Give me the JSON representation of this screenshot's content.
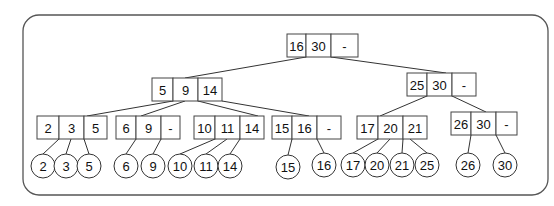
{
  "diagram": {
    "type": "2-3-4 tree / B-tree",
    "frame": {
      "x": 23,
      "y": 15,
      "w": 525,
      "h": 180,
      "r": 16
    },
    "nodes": [
      {
        "id": "root",
        "keys": [
          "16",
          "30",
          "-"
        ],
        "x": 287,
        "y": 34,
        "cells": [
          19,
          25,
          27
        ],
        "h": 23
      },
      {
        "id": "n5_9_14",
        "keys": [
          "5",
          "9",
          "14"
        ],
        "x": 152,
        "y": 78,
        "cells": [
          21,
          25,
          24
        ],
        "h": 23
      },
      {
        "id": "n25_30",
        "keys": [
          "25",
          "30",
          "-"
        ],
        "x": 407,
        "y": 73,
        "cells": [
          20,
          25,
          24
        ],
        "h": 23
      },
      {
        "id": "n2_3_5",
        "keys": [
          "2",
          "3",
          "5"
        ],
        "x": 37,
        "y": 116,
        "cells": [
          22,
          25,
          23
        ],
        "h": 23
      },
      {
        "id": "n6_9",
        "keys": [
          "6",
          "9",
          "-"
        ],
        "x": 116,
        "y": 116,
        "cells": [
          20,
          25,
          19
        ],
        "h": 23
      },
      {
        "id": "n10_11_14",
        "keys": [
          "10",
          "11",
          "14"
        ],
        "x": 194,
        "y": 116,
        "cells": [
          21,
          25,
          24
        ],
        "h": 23
      },
      {
        "id": "n15_16",
        "keys": [
          "15",
          "16",
          "-"
        ],
        "x": 272,
        "y": 116,
        "cells": [
          20,
          25,
          24
        ],
        "h": 23
      },
      {
        "id": "n17_20_21",
        "keys": [
          "17",
          "20",
          "21"
        ],
        "x": 357,
        "y": 116,
        "cells": [
          21,
          25,
          24
        ],
        "h": 23
      },
      {
        "id": "n26_30",
        "keys": [
          "26",
          "30",
          "-"
        ],
        "x": 451,
        "y": 112,
        "cells": [
          20,
          25,
          21
        ],
        "h": 23
      }
    ],
    "leaves": [
      {
        "label": "2",
        "cx": 43,
        "cy": 166
      },
      {
        "label": "3",
        "cx": 66,
        "cy": 166
      },
      {
        "label": "5",
        "cx": 89,
        "cy": 166
      },
      {
        "label": "6",
        "cx": 126,
        "cy": 166
      },
      {
        "label": "9",
        "cx": 153,
        "cy": 166
      },
      {
        "label": "10",
        "cx": 180,
        "cy": 166
      },
      {
        "label": "11",
        "cx": 206,
        "cy": 166
      },
      {
        "label": "14",
        "cx": 230,
        "cy": 166
      },
      {
        "label": "15",
        "cx": 288,
        "cy": 167
      },
      {
        "label": "16",
        "cx": 324,
        "cy": 165
      },
      {
        "label": "17",
        "cx": 353,
        "cy": 165
      },
      {
        "label": "20",
        "cx": 377,
        "cy": 165
      },
      {
        "label": "21",
        "cx": 402,
        "cy": 165
      },
      {
        "label": "25",
        "cx": 427,
        "cy": 165
      },
      {
        "label": "26",
        "cx": 468,
        "cy": 165
      },
      {
        "label": "30",
        "cx": 505,
        "cy": 165
      }
    ],
    "leaf_radius": 12,
    "edges": [
      [
        306,
        57,
        185,
        78
      ],
      [
        331,
        57,
        446,
        73
      ],
      [
        173,
        101,
        87,
        116
      ],
      [
        185,
        101,
        141,
        116
      ],
      [
        198,
        101,
        258,
        116
      ],
      [
        222,
        101,
        309,
        116
      ],
      [
        427,
        96,
        380,
        116
      ],
      [
        452,
        96,
        486,
        112
      ],
      [
        59,
        139,
        43,
        154
      ],
      [
        71,
        139,
        66,
        154
      ],
      [
        84,
        139,
        89,
        154
      ],
      [
        136,
        139,
        126,
        154
      ],
      [
        161,
        139,
        153,
        154
      ],
      [
        215,
        139,
        180,
        154
      ],
      [
        227,
        139,
        206,
        154
      ],
      [
        240,
        139,
        230,
        154
      ],
      [
        292,
        139,
        288,
        155
      ],
      [
        317,
        139,
        324,
        153
      ],
      [
        378,
        139,
        353,
        153
      ],
      [
        390,
        139,
        377,
        153
      ],
      [
        403,
        139,
        402,
        153
      ],
      [
        410,
        139,
        427,
        153
      ],
      [
        471,
        135,
        468,
        153
      ],
      [
        496,
        135,
        505,
        153
      ]
    ]
  }
}
